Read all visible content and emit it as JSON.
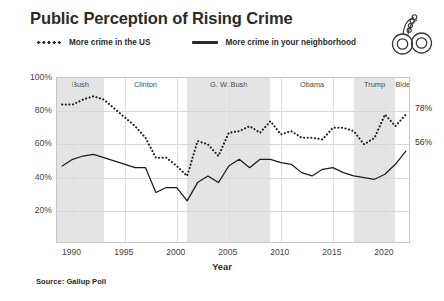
{
  "title": "Public Perception of Rising Crime",
  "source_note": "Source: Gallup Poll",
  "icon": {
    "name": "handcuffs-icon"
  },
  "legend": {
    "items": [
      {
        "label": "More crime in the US",
        "style": "dotted"
      },
      {
        "label": "More crime in your neighborhood",
        "style": "solid"
      }
    ]
  },
  "annotations": {
    "us_end_label": "78%",
    "neighborhood_end_label": "56%"
  },
  "chart_data": {
    "type": "line",
    "title": "Public Perception of Rising Crime",
    "xlabel": "Year",
    "ylabel": "",
    "xlim": [
      1988.5,
      2022.5
    ],
    "ylim": [
      0,
      100
    ],
    "grid": true,
    "legend_position": "top",
    "x_ticks": [
      1990,
      1995,
      2000,
      2005,
      2010,
      2015,
      2020
    ],
    "y_ticks": [
      20,
      40,
      60,
      80,
      100
    ],
    "y_tick_labels": [
      "20%",
      "40%",
      "60%",
      "80%",
      "100%"
    ],
    "x": [
      1989,
      1990,
      1991,
      1992,
      1993,
      1996,
      1997,
      1998,
      1999,
      2000,
      2001,
      2002,
      2003,
      2004,
      2005,
      2006,
      2007,
      2008,
      2009,
      2010,
      2011,
      2012,
      2013,
      2014,
      2015,
      2016,
      2017,
      2018,
      2019,
      2020,
      2021,
      2022
    ],
    "series": [
      {
        "name": "More crime in the US",
        "style": "dotted",
        "color": "#1d1d1d",
        "values": [
          84,
          84,
          87,
          89,
          87,
          71,
          64,
          52,
          52,
          47,
          41,
          62,
          60,
          53,
          67,
          68,
          71,
          67,
          74,
          66,
          68,
          64,
          64,
          63,
          70,
          70,
          68,
          60,
          64,
          78,
          71,
          78
        ]
      },
      {
        "name": "More crime in your neighborhood",
        "style": "solid",
        "color": "#1d1d1d",
        "values": [
          47,
          51,
          53,
          54,
          52,
          46,
          46,
          31,
          34,
          34,
          26,
          37,
          41,
          37,
          47,
          51,
          46,
          51,
          51,
          49,
          48,
          43,
          41,
          45,
          46,
          43,
          41,
          40,
          39,
          42,
          48,
          56
        ]
      }
    ],
    "era_bands": [
      {
        "label": "Bush",
        "start": 1989,
        "end": 1993,
        "shaded": true
      },
      {
        "label": "Clinton",
        "start": 1993,
        "end": 2001,
        "shaded": false
      },
      {
        "label": "G. W. Bush",
        "start": 2001,
        "end": 2009,
        "shaded": true
      },
      {
        "label": "Obama",
        "start": 2009,
        "end": 2017,
        "shaded": false
      },
      {
        "label": "Trump",
        "start": 2017,
        "end": 2021,
        "shaded": true
      },
      {
        "label": "Biden",
        "start": 2021,
        "end": 2022.5,
        "shaded": false
      }
    ]
  }
}
